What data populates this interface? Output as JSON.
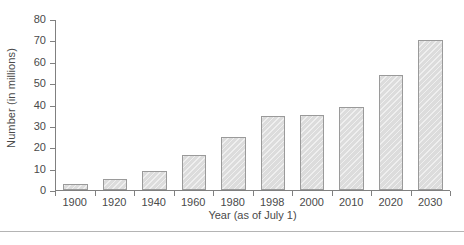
{
  "chart_data": {
    "type": "bar",
    "title": "",
    "xlabel": "Year (as of July 1)",
    "ylabel": "Number (in millions)",
    "categories": [
      "1900",
      "1920",
      "1940",
      "1960",
      "1980",
      "1998",
      "2000",
      "2010",
      "2020",
      "2030"
    ],
    "values": [
      3,
      5,
      9,
      16.5,
      25,
      35,
      35.5,
      39,
      54,
      70.5
    ],
    "ylim": [
      0,
      80
    ],
    "yticks": [
      0,
      10,
      20,
      30,
      40,
      50,
      60,
      70,
      80
    ],
    "ytick_labels": [
      "0",
      "10",
      "20",
      "30",
      "40",
      "50",
      "60",
      "70",
      "80"
    ],
    "grid": false,
    "legend": null,
    "colors": {
      "bar_fill": "#dcdcdc",
      "bar_border": "#9a9a9a",
      "axis": "#808080",
      "text": "#4a4a4a",
      "background": "#ffffff",
      "footer_rule": "#b4b4b4"
    }
  }
}
